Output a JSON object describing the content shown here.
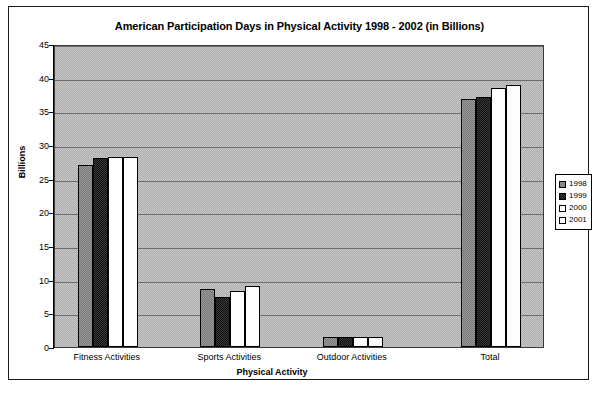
{
  "chart_data": {
    "type": "bar",
    "title": "American Participation Days in Physical Activity 1998 - 2002 (in Billions)",
    "xlabel": "Physical Activity",
    "ylabel": "Billions",
    "categories": [
      "Fitness Activities",
      "Sports Activities",
      "Outdoor Activities",
      "Total"
    ],
    "series": [
      {
        "name": "1998",
        "values": [
          27.0,
          8.6,
          1.5,
          36.8
        ],
        "color": "#8a8a8a"
      },
      {
        "name": "1999",
        "values": [
          28.0,
          7.5,
          1.5,
          37.2
        ],
        "color": "#262626"
      },
      {
        "name": "2000",
        "values": [
          28.2,
          8.3,
          1.5,
          38.4
        ],
        "color": "#ffffff"
      },
      {
        "name": "2001",
        "values": [
          28.2,
          9.1,
          1.5,
          38.9
        ],
        "color": "#fdfdfd"
      }
    ],
    "ylim": [
      0,
      45
    ],
    "yticks": [
      0,
      5,
      10,
      15,
      20,
      25,
      30,
      35,
      40,
      45
    ],
    "ytick_labels": [
      "0",
      "5",
      "10",
      "15",
      "20",
      "25",
      "30",
      "35",
      "40",
      "45"
    ],
    "grid": true,
    "legend_position": "right",
    "legend_entries": [
      "1998",
      "1999",
      "2000",
      "2001"
    ],
    "plot_background": "#b9b9b9"
  }
}
